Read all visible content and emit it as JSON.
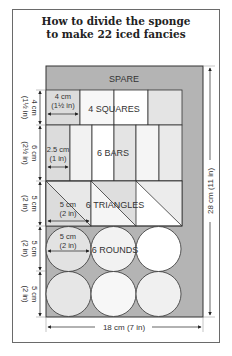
{
  "title": {
    "line1": "How to divide the sponge",
    "line2": "to make 22 iced fancies"
  },
  "sections": {
    "spare": "SPARE",
    "squares": "4 SQUARES",
    "bars": "6 BARS",
    "triangles": "6 TRIANGLES",
    "rounds": "6 ROUNDS"
  },
  "inner_dims": {
    "square_width_cm": "4 cm",
    "square_width_in": "(1½ in)",
    "bar_width_cm": "2.5 cm",
    "bar_width_in": "(1 in)",
    "triangle_width_cm": "5 cm",
    "triangle_width_in": "(2 in)",
    "round_diameter_cm": "5 cm",
    "round_diameter_in": "(2 in)"
  },
  "left_dims": [
    {
      "cm": "4 cm",
      "in": "(1½ in)"
    },
    {
      "cm": "6 cm",
      "in": "(2½ in)"
    },
    {
      "cm": "5 cm",
      "in": "(2 in)"
    },
    {
      "cm": "5 cm",
      "in": "(2 in)"
    },
    {
      "cm": "5 cm",
      "in": "(2 in)"
    }
  ],
  "overall": {
    "height": "28 cm (11 in)",
    "width": "18 cm (7 in)"
  },
  "colors": {
    "spare_gray": "#b4b4b4",
    "light_gray": "#e2e2e2",
    "white": "#ffffff",
    "line": "#333333"
  }
}
